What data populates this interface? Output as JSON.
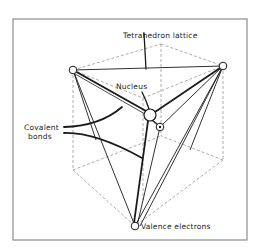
{
  "diagram": {
    "labels": {
      "lattice": "Tetrahedron lattice",
      "nucleus": "Nucleus",
      "covalent_line1": "Covalent",
      "covalent_line2": "bonds",
      "valence": "Valence electrons"
    },
    "colors": {
      "ink": "#1a1a1a",
      "dashed": "#8a8a8a",
      "frame": "#8c8c8c",
      "background": "#ffffff"
    }
  }
}
